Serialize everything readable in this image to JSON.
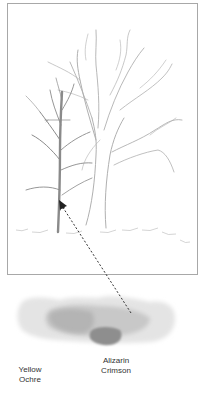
{
  "illustration": {
    "subject": "pencil sketch of two bare trees",
    "frame_color": "#a8a8a8",
    "sketch_color": "#8c8c8c"
  },
  "swatch": {
    "description": "watercolor wash blending two pigments",
    "colors": {
      "light": "#e6e6e6",
      "mid": "#bdbdbd",
      "dark": "#8f8f8f"
    }
  },
  "labels": {
    "yellow_ochre_line1": "Yellow",
    "yellow_ochre_line2": "Ochre",
    "alizarin_line1": "Alizarin",
    "alizarin_line2": "Crimson"
  },
  "arrow": {
    "style": "dashed",
    "from": "swatch",
    "to": "small tree trunk"
  }
}
